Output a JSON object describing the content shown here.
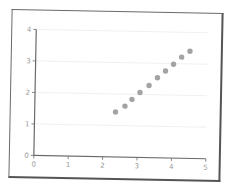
{
  "chart_data": {
    "type": "scatter",
    "title": "",
    "xlabel": "",
    "ylabel": "",
    "xlim": [
      0,
      5
    ],
    "ylim": [
      0,
      4
    ],
    "x_ticks": [
      "0",
      "1",
      "2",
      "3",
      "4",
      "5"
    ],
    "y_ticks": [
      "0",
      "1",
      "2",
      "3",
      "4"
    ],
    "grid": {
      "horizontal": true,
      "vertical": false
    },
    "legend": null,
    "series": [
      {
        "name": "points",
        "color": "#a3a3a3",
        "x": [
          2.35,
          2.62,
          2.82,
          3.05,
          3.31,
          3.55,
          3.78,
          4.01,
          4.24,
          4.48
        ],
        "y": [
          1.43,
          1.62,
          1.84,
          2.06,
          2.29,
          2.54,
          2.76,
          2.98,
          3.21,
          3.4
        ]
      }
    ]
  },
  "colors": {
    "frame": "#6a6a6a",
    "axis": "#6a6a6a",
    "tick_label": "#9a9a9a",
    "grid": "#ececec",
    "point": "#a3a3a3",
    "background": "#ffffff"
  }
}
